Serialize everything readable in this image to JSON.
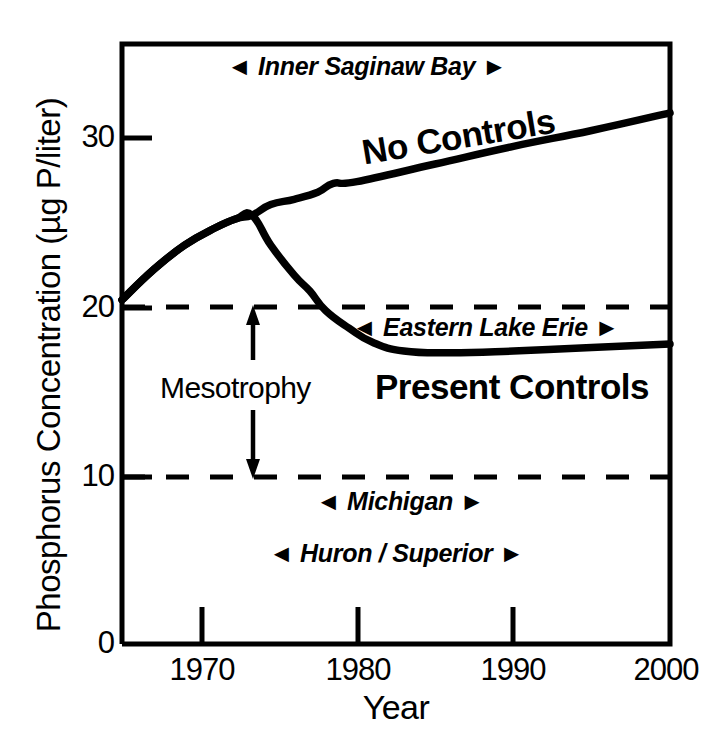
{
  "chart_data": {
    "type": "line",
    "title": "",
    "xlabel": "Year",
    "ylabel": "Phosphorus Concentration (µg P/liter)",
    "xlim": [
      1965,
      2000
    ],
    "ylim": [
      0,
      34
    ],
    "grid": false,
    "legend_position": "inline-curve-labels",
    "xticks": [
      1970,
      1980,
      1990,
      2000
    ],
    "xtick_labels": [
      "1970",
      "1980",
      "1990",
      "2000"
    ],
    "yticks": [
      0,
      10,
      20,
      30
    ],
    "ytick_labels": [
      "0",
      "10",
      "20",
      "30"
    ],
    "series": [
      {
        "name": "No Controls",
        "x": [
          1965,
          1967,
          1969,
          1971,
          1972.3,
          1973.3,
          1974.5,
          1976,
          1977.5,
          1978.5,
          1980,
          1985,
          1990,
          1995,
          2000
        ],
        "values": [
          19.5,
          21.2,
          22.6,
          23.6,
          24.1,
          24.3,
          24.9,
          25.2,
          25.6,
          26.1,
          26.2,
          27.2,
          28.2,
          29.1,
          30.1
        ]
      },
      {
        "name": "Present Controls",
        "x": [
          1965,
          1967,
          1969,
          1971,
          1972.3,
          1973.3,
          1974.5,
          1976,
          1977,
          1978,
          1979.5,
          1981,
          1983,
          1986,
          1990,
          1995,
          2000
        ],
        "values": [
          19.5,
          21.2,
          22.6,
          23.6,
          24.1,
          24.3,
          22.6,
          20.9,
          20.0,
          18.9,
          17.9,
          17.1,
          16.6,
          16.5,
          16.6,
          16.8,
          17.0
        ]
      }
    ],
    "reference_lines": [
      {
        "name": "upper-mesotrophy-line",
        "value": 20,
        "style": "dashed"
      },
      {
        "name": "lower-mesotrophy-line",
        "value": 10,
        "style": "dashed"
      }
    ],
    "annotations": [
      {
        "name": "inner-saginaw-bay",
        "text": "Inner Saginaw Bay",
        "left_arrow": "◄",
        "right_arrow": "►"
      },
      {
        "name": "eastern-lake-erie",
        "text": "Eastern Lake Erie",
        "left_arrow": "◄",
        "right_arrow": "►"
      },
      {
        "name": "michigan",
        "text": "Michigan",
        "left_arrow": "◄",
        "right_arrow": "►"
      },
      {
        "name": "huron-superior",
        "text": "Huron / Superior",
        "left_arrow": "◄",
        "right_arrow": "►"
      },
      {
        "name": "mesotrophy",
        "text": "Mesotrophy",
        "span_from": 10,
        "span_to": 20
      }
    ],
    "colors": {
      "line": "#000000",
      "background": "#ffffff",
      "text": "#000000"
    }
  },
  "axes": {
    "y_title": "Phosphorus Concentration (µg P/liter)",
    "x_title": "Year",
    "y_ticks": [
      "30",
      "20",
      "10",
      "0"
    ],
    "x_ticks": [
      "1970",
      "1980",
      "1990",
      "2000"
    ]
  },
  "labels": {
    "no_controls": "No Controls",
    "present_controls": "Present Controls",
    "mesotrophy": "Mesotrophy",
    "inner_saginaw_bay": "Inner Saginaw Bay",
    "eastern_lake_erie": "Eastern Lake Erie",
    "michigan": "Michigan",
    "huron_superior": "Huron / Superior",
    "arrow_left": "◄",
    "arrow_right": "►"
  }
}
